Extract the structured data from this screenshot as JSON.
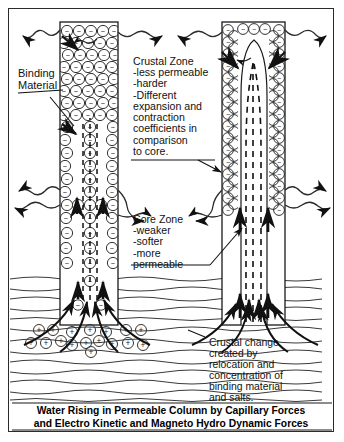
{
  "figure": {
    "caption_line1": "Water Rising in Permeable Column by Capillary Forces",
    "caption_line2": "and Electro Kinetic and Magneto Hydro Dynamic Forces"
  },
  "labels": {
    "binding_material": "Binding\nMaterial",
    "crustal_zone": "Crustal Zone\n-less permeable\n-harder\n-Different\nexpansion and\ncontraction\ncoefficients in\ncomparison\nto core.",
    "core_zone": "Core Zone\n-weaker\n-softer\n-more\npermeable",
    "crustal_change": "Crustal change\ncreated by\nrelocation and\nconcentration of\nbinding material\nand salts."
  },
  "symbols": {
    "negative_particle": "−",
    "positive_particle": "+"
  },
  "colors": {
    "ink": "#1a1a1a",
    "frame": "#2b2b2b",
    "paper": "#ffffff",
    "stratum": "#3a3a3a"
  },
  "columns": {
    "left": {
      "x": 60,
      "width": 58,
      "top": 22,
      "bottom": 325,
      "core_x": 89,
      "style": "packed-negative-particles"
    },
    "right": {
      "x": 222,
      "width": 63,
      "top": 22,
      "bottom": 325,
      "core_x": 253,
      "style": "hollow-core-with-crust"
    }
  },
  "counts": {
    "strata_lines": 12,
    "wavy_emission_arrows": 14
  }
}
